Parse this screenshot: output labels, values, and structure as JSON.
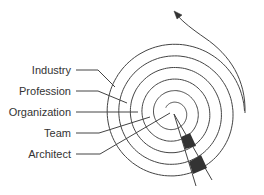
{
  "diagram": {
    "type": "spiral",
    "center": [
      173,
      113
    ],
    "labels": [
      {
        "id": "industry",
        "text": "Industry",
        "y": 70
      },
      {
        "id": "profession",
        "text": "Profession",
        "y": 91
      },
      {
        "id": "organization",
        "text": "Organization",
        "y": 112
      },
      {
        "id": "team",
        "text": "Team",
        "y": 133
      },
      {
        "id": "architect",
        "text": "Architect",
        "y": 154
      }
    ],
    "colors": {
      "stroke": "#444444",
      "text": "#333333",
      "wedge_fill": "#333333",
      "background": "#ffffff"
    },
    "arrow_direction": "outward-up-left"
  }
}
